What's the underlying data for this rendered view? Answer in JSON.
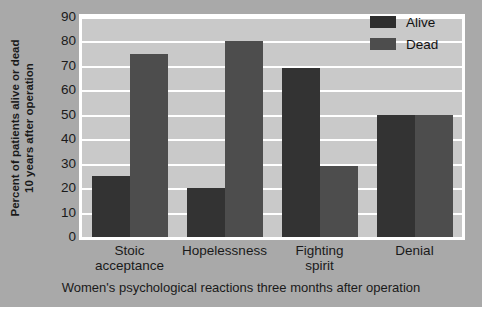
{
  "chart_data": {
    "type": "bar",
    "title": "",
    "categories": [
      "Stoic acceptance",
      "Hopelessness",
      "Fighting spirit",
      "Denial"
    ],
    "category_lines": [
      [
        "Stoic",
        "acceptance"
      ],
      [
        "Hopelessness",
        ""
      ],
      [
        "Fighting",
        "spirit"
      ],
      [
        "Denial",
        ""
      ]
    ],
    "series": [
      {
        "name": "Alive",
        "values": [
          25,
          20,
          69,
          50
        ],
        "color": "#333333"
      },
      {
        "name": "Dead",
        "values": [
          75,
          80,
          29,
          50
        ],
        "color": "#4d4d4d"
      }
    ],
    "xlabel": "Women's psychological reactions three months after operation",
    "ylabel": "Percent of patients alive or dead 10 years after operation",
    "ylabel_lines": [
      "Percent of patients alive or dead",
      "10 years after operation"
    ],
    "ylim": [
      0,
      90
    ],
    "ytick_values": [
      0,
      10,
      20,
      30,
      40,
      50,
      60,
      70,
      80,
      90
    ],
    "ytick_labels": [
      "0",
      "10",
      "20",
      "30",
      "40",
      "50",
      "60",
      "70",
      "80",
      "90"
    ],
    "grid": true,
    "legend_position": "top-right",
    "plot_background": "#c9c9c9",
    "figure_background": "#a9a9a9",
    "gridline_color": "#ffffff"
  }
}
